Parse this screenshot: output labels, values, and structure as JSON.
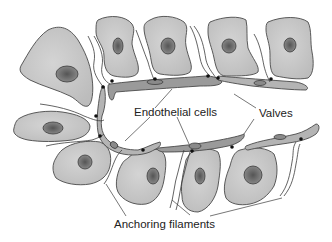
{
  "diagram": {
    "labels": {
      "endothelial_cells": "Endothelial cells",
      "valves": "Valves",
      "anchoring_filaments": "Anchoring filaments"
    },
    "colors": {
      "background": "#ffffff",
      "tissue_cell_fill": "#c8c8c8",
      "tissue_nucleus_fill": "#6a6a6a",
      "endothelial_fill": "#9a9a9a",
      "outline": "#4a4a4a",
      "anchor_point": "#111111",
      "label_text": "#222222"
    },
    "elements": {
      "tissue_cells_count": 10,
      "endothelial_cells_count": 5,
      "anchor_points_count": 12
    }
  }
}
